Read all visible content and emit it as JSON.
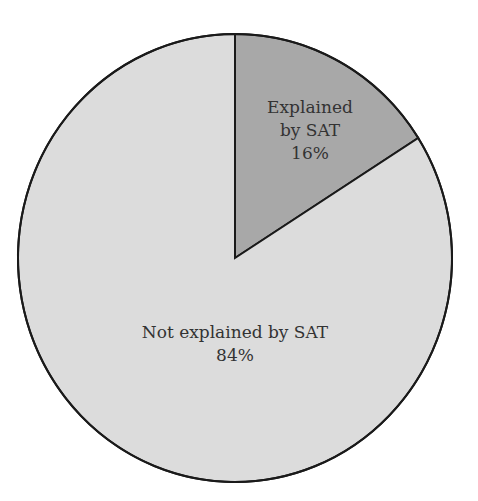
{
  "chart_data": {
    "type": "pie",
    "title": "",
    "slices": [
      {
        "label": "Explained by SAT",
        "label_lines": [
          "Explained",
          "by SAT"
        ],
        "value": 16,
        "value_text": "16%",
        "color": "#a8a8a8"
      },
      {
        "label": "Not explained by SAT",
        "label_lines": [
          "Not explained by SAT"
        ],
        "value": 84,
        "value_text": "84%",
        "color": "#dcdcdc"
      }
    ],
    "start_angle_deg": 0,
    "direction": "clockwise",
    "legend": "none",
    "outline_color": "#1a1a1a"
  }
}
